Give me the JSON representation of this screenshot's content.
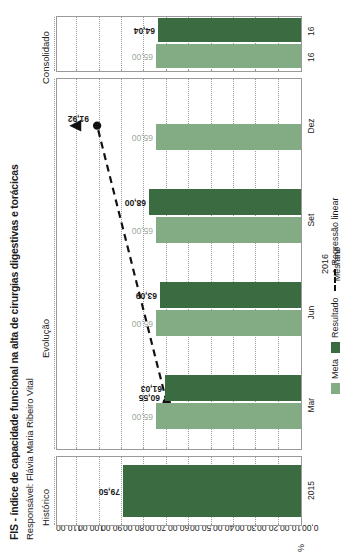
{
  "header": {
    "title": "FIS - índice de capacidade funcional na alta de cirurgias digestivas e torácicas",
    "subtitle": "Responsável: Flávia Maria Ribeiro Vital"
  },
  "sections": {
    "historico": "Histórico",
    "evolucao": "Evolução",
    "consolidado": "Consolidado"
  },
  "axes": {
    "ylabel": "%",
    "xlabel": "Mês/ano",
    "xgroup_year": "2016",
    "yticks": [
      "110,00",
      "100,00",
      "90,00",
      "80,00",
      "70,00",
      "60,00",
      "50,00",
      "40,00",
      "30,00",
      "20,00",
      "10,00",
      "0,00"
    ],
    "ymin": 0,
    "ymax": 110
  },
  "legend": {
    "meta": "Meta",
    "resultado": "Resultado",
    "regressao": "Regressão linear"
  },
  "colors": {
    "meta": "#83ab84",
    "resultado": "#3b6b41",
    "regressao": "#111111",
    "grid": "#9b9b9b",
    "frame": "#9a9a9a"
  },
  "chart_data": {
    "type": "bar",
    "title": "FIS - índice de capacidade funcional na alta de cirurgias digestivas e torácicas",
    "subtitle": "Responsável: Flávia Maria Ribeiro Vital",
    "xlabel": "Mês/ano",
    "ylabel": "%",
    "ylim": [
      0,
      110
    ],
    "yticks": [
      0,
      10,
      20,
      30,
      40,
      50,
      60,
      70,
      80,
      90,
      100,
      110
    ],
    "grid": true,
    "legend_position": "bottom",
    "panels": [
      {
        "name": "Histórico",
        "categories": [
          "2015"
        ],
        "series": [
          {
            "name": "Resultado",
            "values": [
              79.5
            ],
            "labels": [
              "79,50"
            ]
          }
        ]
      },
      {
        "name": "Evolução",
        "categories": [
          "Mar",
          "Jun",
          "Set",
          "Dez"
        ],
        "group_label": "2016",
        "series": [
          {
            "name": "Meta",
            "values": [
              65.0,
              65.0,
              65.0,
              65.0
            ],
            "labels": [
              "65,00",
              "65,00",
              "65,00",
              "65,00"
            ]
          },
          {
            "name": "Resultado",
            "values": [
              61.03,
              63.09,
              68.0,
              null
            ],
            "labels": [
              "61,03",
              "63,09",
              "68,00",
              ""
            ]
          },
          {
            "name": "Regressão linear",
            "values": [
              60.55,
              null,
              null,
              91.92
            ],
            "labels": [
              "60,55",
              "",
              "",
              "91,92"
            ]
          }
        ]
      },
      {
        "name": "Consolidado",
        "categories": [
          "16",
          "16"
        ],
        "series": [
          {
            "name": "Meta",
            "values": [
              65.0
            ],
            "labels": [
              "65,00"
            ]
          },
          {
            "name": "Resultado",
            "values": [
              64.04
            ],
            "labels": [
              "64,04"
            ]
          }
        ]
      }
    ]
  }
}
